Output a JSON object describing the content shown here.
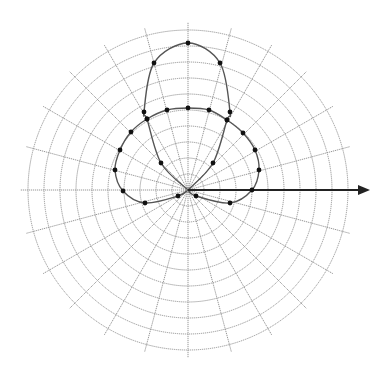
{
  "title_fragment": "",
  "chart_data": {
    "type": "polar",
    "title": "",
    "grid": {
      "center_px": [
        188,
        190
      ],
      "rings": 10,
      "ring_spacing_px": 16,
      "spoke_step_deg": 15,
      "spoke_extent_px": 168
    },
    "reference_axis": {
      "angle_deg": 0,
      "length_px": 182,
      "arrow": true
    },
    "series": [
      {
        "name": "tall-lobe",
        "description": "narrow vertical lobe (e.g. r = a·sin²θ style pattern)",
        "points_px": [
          [
            188,
            190
          ],
          [
            161,
            163
          ],
          [
            147,
            119
          ],
          [
            144,
            112
          ],
          [
            154,
            63
          ],
          [
            188,
            43
          ],
          [
            220,
            63
          ],
          [
            230,
            112
          ],
          [
            227,
            120
          ],
          [
            213,
            163
          ],
          [
            188,
            190
          ]
        ]
      },
      {
        "name": "wide-lobe",
        "description": "broad cardioid-like lobe",
        "points_px": [
          [
            188,
            190
          ],
          [
            178,
            196
          ],
          [
            145,
            203
          ],
          [
            123,
            191
          ],
          [
            115,
            170
          ],
          [
            120,
            150
          ],
          [
            131,
            132
          ],
          [
            147,
            119
          ],
          [
            167,
            110
          ],
          [
            188,
            108
          ],
          [
            209,
            110
          ],
          [
            227,
            120
          ],
          [
            243,
            133
          ],
          [
            255,
            150
          ],
          [
            259,
            170
          ],
          [
            252,
            190
          ],
          [
            230,
            203
          ],
          [
            196,
            196
          ],
          [
            188,
            190
          ]
        ]
      }
    ],
    "colors": {
      "grid": "#8a8a8a",
      "curve": "#555555",
      "dot": "#111111",
      "axis": "#222222"
    }
  }
}
